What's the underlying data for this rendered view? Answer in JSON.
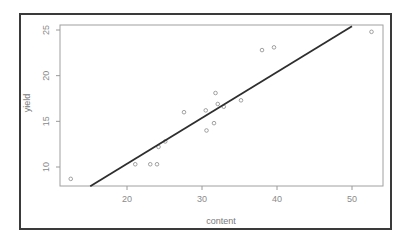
{
  "chart_data": {
    "type": "scatter",
    "title": "",
    "xlabel": "content",
    "ylabel": "yield",
    "xlim": [
      10.6,
      53.7
    ],
    "ylim": [
      7.9,
      25.5
    ],
    "x_ticks": [
      20,
      30,
      40,
      50
    ],
    "y_ticks": [
      10,
      15,
      20,
      25
    ],
    "grid": false,
    "legend": null,
    "series": [
      {
        "name": "observations",
        "marker": "open-circle",
        "points": [
          {
            "x": 12.5,
            "y": 8.7
          },
          {
            "x": 21.1,
            "y": 10.3
          },
          {
            "x": 23.1,
            "y": 10.3
          },
          {
            "x": 24.0,
            "y": 10.3
          },
          {
            "x": 24.2,
            "y": 12.2
          },
          {
            "x": 25.1,
            "y": 12.8
          },
          {
            "x": 27.6,
            "y": 16.0
          },
          {
            "x": 30.5,
            "y": 16.2
          },
          {
            "x": 30.6,
            "y": 14.0
          },
          {
            "x": 31.6,
            "y": 14.8
          },
          {
            "x": 31.8,
            "y": 18.1
          },
          {
            "x": 32.1,
            "y": 16.9
          },
          {
            "x": 32.9,
            "y": 16.6
          },
          {
            "x": 35.2,
            "y": 17.3
          },
          {
            "x": 38.0,
            "y": 22.8
          },
          {
            "x": 39.6,
            "y": 23.1
          },
          {
            "x": 52.6,
            "y": 24.8
          }
        ]
      },
      {
        "name": "fitted line",
        "type": "line",
        "points": [
          {
            "x": 15.1,
            "y": 7.9
          },
          {
            "x": 50.0,
            "y": 25.4
          }
        ]
      }
    ],
    "colors": {
      "points": "#8a8a8a",
      "line": "#2e2e2e",
      "axes": "#9a9a9a",
      "frame": "#3a3a3a"
    }
  },
  "axes": {
    "x_label": "content",
    "y_label": "yield",
    "x_tick_labels": [
      "20",
      "30",
      "40",
      "50"
    ],
    "y_tick_labels": [
      "10",
      "15",
      "20",
      "25"
    ]
  }
}
